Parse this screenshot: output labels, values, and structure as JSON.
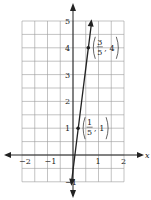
{
  "chart_data": {
    "type": "line",
    "title": "",
    "xlabel": "x",
    "ylabel": "",
    "xlim": [
      -2,
      2
    ],
    "ylim": [
      -1,
      5
    ],
    "grid": true,
    "grid_step": 0.5,
    "x_ticks": [
      "-2",
      "-1",
      "1",
      "2"
    ],
    "y_ticks": [
      "-1",
      "1",
      "2",
      "3",
      "4",
      "5"
    ],
    "series": [
      {
        "name": "line",
        "slope": 7.5,
        "intercept": -0.5,
        "points": [
          {
            "x": 0.2,
            "y": 1,
            "label_num": "1",
            "label_den": "5",
            "label_y": "1"
          },
          {
            "x": 0.6,
            "y": 4,
            "label_num": "3",
            "label_den": "5",
            "label_y": "4"
          }
        ]
      }
    ]
  },
  "axis": {
    "x_label": "x"
  }
}
